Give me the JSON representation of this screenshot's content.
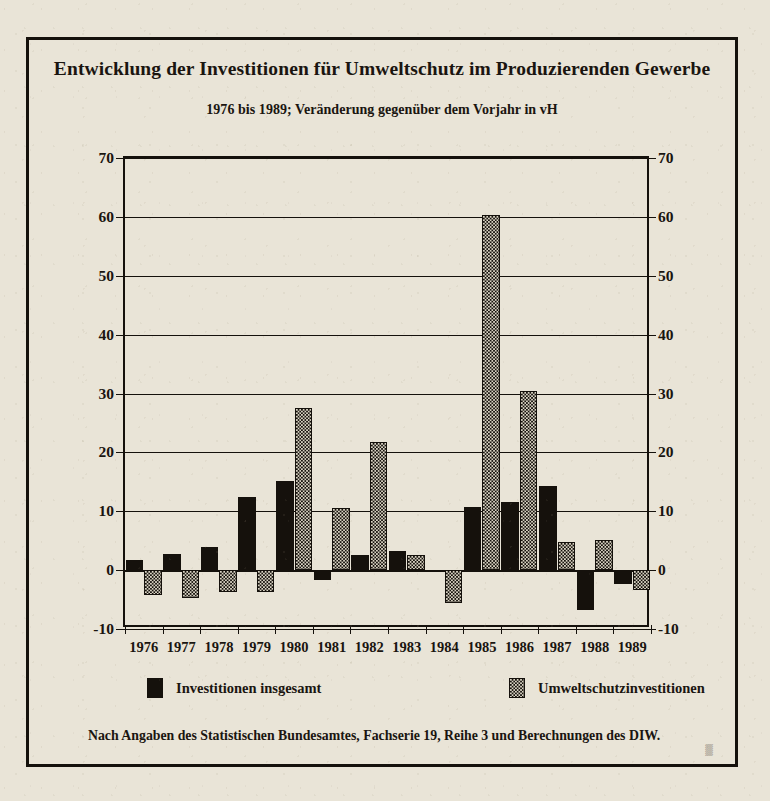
{
  "chart_data": {
    "type": "bar",
    "title": "Entwicklung der Investitionen für Umweltschutz im Produzierenden Gewerbe",
    "subtitle": "1976 bis 1989; Veränderung gegenüber dem Vorjahr in vH",
    "xlabel": "",
    "ylabel": "",
    "ylim": [
      -10,
      70
    ],
    "yticks": [
      -10,
      0,
      10,
      20,
      30,
      40,
      50,
      60,
      70
    ],
    "ytick_labels": [
      "-10",
      "0",
      "10",
      "20",
      "30",
      "40",
      "50",
      "60",
      "70"
    ],
    "grid": true,
    "legend_position": "bottom",
    "categories": [
      "1976",
      "1977",
      "1978",
      "1979",
      "1980",
      "1981",
      "1982",
      "1983",
      "1984",
      "1985",
      "1986",
      "1987",
      "1988",
      "1989"
    ],
    "series": [
      {
        "name": "Investitionen insgesamt",
        "fill": "solid-black",
        "color": "#15110c",
        "values": [
          1.8,
          2.8,
          4.0,
          12.4,
          15.1,
          -1.6,
          2.5,
          3.3,
          0.0,
          10.8,
          11.6,
          14.3,
          -6.8,
          -2.4
        ]
      },
      {
        "name": "Umweltschutzinvestitionen",
        "fill": "stippled",
        "color": "#d9d3c3",
        "values": [
          -4.2,
          -4.8,
          -3.8,
          -3.7,
          27.6,
          10.6,
          21.7,
          2.5,
          -5.5,
          60.4,
          30.4,
          4.8,
          5.1,
          -3.3
        ]
      }
    ]
  },
  "legend": {
    "items": [
      {
        "label": "Investitionen insgesamt",
        "swatch": "total"
      },
      {
        "label": "Umweltschutzinvestitionen",
        "swatch": "env"
      }
    ]
  },
  "source": {
    "note": "Nach Angaben des Statistischen Bundesamtes, Fachserie 19, Reihe 3 und Berechnungen des DIW.",
    "mark": "▒"
  },
  "colors": {
    "paper": "#e9e4d7",
    "ink": "#15110c",
    "stipple_bg": "#d9d3c3"
  }
}
